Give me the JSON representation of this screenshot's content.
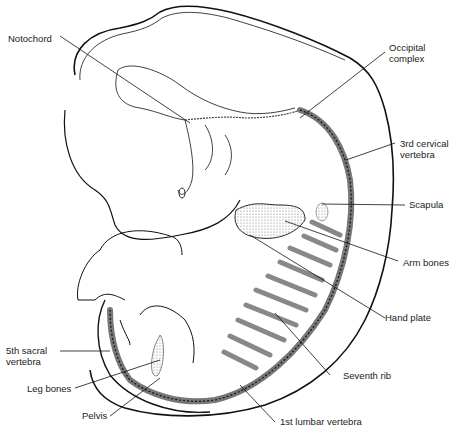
{
  "figure": {
    "labels": {
      "notochord": "Notochord",
      "occipital_1": "Occipital",
      "occipital_2": "complex",
      "cervical_1": "3rd cervical",
      "cervical_2": "vertebra",
      "scapula": "Scapula",
      "arm_bones": "Arm bones",
      "hand_plate": "Hand plate",
      "seventh_rib": "Seventh rib",
      "lumbar": "1st lumbar vertebra",
      "sacral_1": "5th sacral",
      "sacral_2": "vertebra",
      "leg_bones": "Leg bones",
      "pelvis": "Pelvis"
    },
    "colors": {
      "line": "#111111",
      "stipple": "#9a9a9a",
      "background": "#ffffff"
    }
  }
}
